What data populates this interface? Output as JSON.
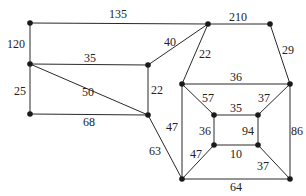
{
  "diagram": {
    "type": "weighted-graph",
    "nodes": [
      {
        "id": "A",
        "x": 30,
        "y": 23
      },
      {
        "id": "B",
        "x": 208,
        "y": 24
      },
      {
        "id": "C",
        "x": 270,
        "y": 24
      },
      {
        "id": "D",
        "x": 30,
        "y": 64
      },
      {
        "id": "E",
        "x": 148,
        "y": 65
      },
      {
        "id": "F",
        "x": 30,
        "y": 114
      },
      {
        "id": "G",
        "x": 148,
        "y": 115
      },
      {
        "id": "H",
        "x": 182,
        "y": 84
      },
      {
        "id": "I",
        "x": 290,
        "y": 84
      },
      {
        "id": "J",
        "x": 214,
        "y": 115
      },
      {
        "id": "K",
        "x": 258,
        "y": 115
      },
      {
        "id": "L",
        "x": 214,
        "y": 145
      },
      {
        "id": "M",
        "x": 258,
        "y": 145
      },
      {
        "id": "N",
        "x": 182,
        "y": 179
      },
      {
        "id": "O",
        "x": 290,
        "y": 179
      }
    ],
    "edges": [
      {
        "from": "A",
        "to": "B",
        "weight": "135",
        "lx": 118,
        "ly": 18,
        "anchor": "middle"
      },
      {
        "from": "A",
        "to": "D",
        "weight": "120",
        "lx": 16,
        "ly": 48,
        "anchor": "middle"
      },
      {
        "from": "B",
        "to": "C",
        "weight": "210",
        "lx": 238,
        "ly": 21,
        "anchor": "middle"
      },
      {
        "from": "D",
        "to": "E",
        "weight": "35",
        "lx": 90,
        "ly": 62,
        "anchor": "middle"
      },
      {
        "from": "E",
        "to": "B",
        "weight": "40",
        "lx": 170,
        "ly": 46,
        "anchor": "middle"
      },
      {
        "from": "D",
        "to": "F",
        "weight": "25",
        "lx": 20,
        "ly": 95,
        "anchor": "middle"
      },
      {
        "from": "D",
        "to": "G",
        "weight": "50",
        "lx": 88,
        "ly": 96,
        "anchor": "middle"
      },
      {
        "from": "E",
        "to": "G",
        "weight": "22",
        "lx": 157,
        "ly": 94,
        "anchor": "middle"
      },
      {
        "from": "F",
        "to": "G",
        "weight": "68",
        "lx": 89,
        "ly": 126,
        "anchor": "middle"
      },
      {
        "from": "B",
        "to": "H",
        "weight": "22",
        "lx": 205,
        "ly": 58,
        "anchor": "middle"
      },
      {
        "from": "C",
        "to": "I",
        "weight": "29",
        "lx": 288,
        "ly": 54,
        "anchor": "middle"
      },
      {
        "from": "H",
        "to": "I",
        "weight": "36",
        "lx": 236,
        "ly": 81,
        "anchor": "middle"
      },
      {
        "from": "H",
        "to": "J",
        "weight": "57",
        "lx": 208,
        "ly": 102,
        "anchor": "middle"
      },
      {
        "from": "I",
        "to": "K",
        "weight": "37",
        "lx": 264,
        "ly": 102,
        "anchor": "middle"
      },
      {
        "from": "J",
        "to": "K",
        "weight": "35",
        "lx": 236,
        "ly": 112,
        "anchor": "middle"
      },
      {
        "from": "J",
        "to": "L",
        "weight": "36",
        "lx": 205,
        "ly": 135,
        "anchor": "middle"
      },
      {
        "from": "K",
        "to": "M",
        "weight": "94",
        "lx": 248,
        "ly": 135,
        "anchor": "middle"
      },
      {
        "from": "L",
        "to": "M",
        "weight": "10",
        "lx": 236,
        "ly": 158,
        "anchor": "middle"
      },
      {
        "from": "H",
        "to": "N",
        "weight": "47",
        "lx": 172,
        "ly": 131,
        "anchor": "middle"
      },
      {
        "from": "G",
        "to": "N",
        "weight": "63",
        "lx": 155,
        "ly": 155,
        "anchor": "middle"
      },
      {
        "from": "L",
        "to": "N",
        "weight": "47",
        "lx": 196,
        "ly": 158,
        "anchor": "middle"
      },
      {
        "from": "M",
        "to": "O",
        "weight": "37",
        "lx": 263,
        "ly": 170,
        "anchor": "middle"
      },
      {
        "from": "I",
        "to": "O",
        "weight": "86",
        "lx": 297,
        "ly": 135,
        "anchor": "middle"
      },
      {
        "from": "N",
        "to": "O",
        "weight": "64",
        "lx": 236,
        "ly": 191,
        "anchor": "middle"
      }
    ]
  }
}
